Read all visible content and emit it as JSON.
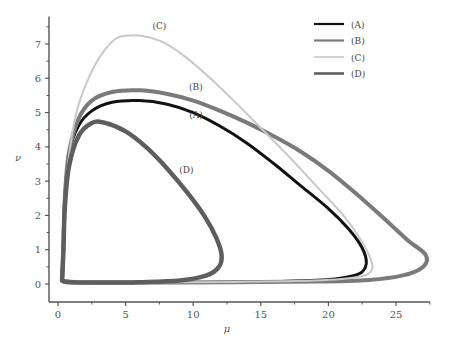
{
  "chart_data": {
    "type": "line",
    "title": "",
    "xlabel": "μ",
    "ylabel": "ν",
    "xlim": [
      -0.5,
      27.5
    ],
    "ylim": [
      -0.35,
      7.8
    ],
    "xticks": [
      0,
      5,
      10,
      15,
      20,
      25
    ],
    "yticks": [
      0,
      1,
      2,
      3,
      4,
      5,
      6,
      7
    ],
    "grid": false,
    "legend_position": "top-right",
    "series": [
      {
        "name": "(A)",
        "color": "#111111",
        "points": [
          [
            0.3,
            0.1
          ],
          [
            0.4,
            1.0
          ],
          [
            0.5,
            2.5
          ],
          [
            0.8,
            3.8
          ],
          [
            1.5,
            4.6
          ],
          [
            2.5,
            5.05
          ],
          [
            4,
            5.3
          ],
          [
            6,
            5.35
          ],
          [
            8,
            5.25
          ],
          [
            10,
            5.0
          ],
          [
            12,
            4.6
          ],
          [
            14,
            4.1
          ],
          [
            16,
            3.5
          ],
          [
            18,
            2.85
          ],
          [
            20,
            2.2
          ],
          [
            21.5,
            1.6
          ],
          [
            22.5,
            1.05
          ],
          [
            22.8,
            0.6
          ],
          [
            22.3,
            0.3
          ],
          [
            20.5,
            0.15
          ],
          [
            17,
            0.08
          ],
          [
            12,
            0.05
          ],
          [
            6,
            0.04
          ],
          [
            1.5,
            0.04
          ],
          [
            0.6,
            0.05
          ],
          [
            0.3,
            0.1
          ]
        ]
      },
      {
        "name": "(B)",
        "color": "#7a7a7a",
        "points": [
          [
            0.3,
            0.1
          ],
          [
            0.4,
            1.0
          ],
          [
            0.5,
            2.5
          ],
          [
            0.8,
            3.8
          ],
          [
            1.5,
            4.8
          ],
          [
            2.5,
            5.35
          ],
          [
            4,
            5.6
          ],
          [
            6,
            5.65
          ],
          [
            8,
            5.55
          ],
          [
            10,
            5.35
          ],
          [
            12,
            5.05
          ],
          [
            14,
            4.7
          ],
          [
            16,
            4.3
          ],
          [
            18,
            3.85
          ],
          [
            20,
            3.3
          ],
          [
            22,
            2.65
          ],
          [
            24,
            1.95
          ],
          [
            25.8,
            1.3
          ],
          [
            27.2,
            0.85
          ],
          [
            27.0,
            0.5
          ],
          [
            25.5,
            0.25
          ],
          [
            23,
            0.12
          ],
          [
            19,
            0.07
          ],
          [
            13,
            0.05
          ],
          [
            6,
            0.04
          ],
          [
            1.5,
            0.04
          ],
          [
            0.6,
            0.05
          ],
          [
            0.3,
            0.1
          ]
        ]
      },
      {
        "name": "(C)",
        "color": "#c8c8c8",
        "points": [
          [
            0.3,
            0.1
          ],
          [
            0.4,
            1.0
          ],
          [
            0.5,
            2.5
          ],
          [
            0.9,
            4.0
          ],
          [
            1.5,
            5.2
          ],
          [
            2.5,
            6.2
          ],
          [
            3.5,
            6.85
          ],
          [
            4.5,
            7.2
          ],
          [
            6,
            7.25
          ],
          [
            7.5,
            7.1
          ],
          [
            9,
            6.75
          ],
          [
            11,
            6.1
          ],
          [
            13,
            5.35
          ],
          [
            15,
            4.55
          ],
          [
            17,
            3.75
          ],
          [
            19,
            2.9
          ],
          [
            21,
            2.05
          ],
          [
            22.3,
            1.35
          ],
          [
            23.1,
            0.75
          ],
          [
            23.2,
            0.4
          ],
          [
            22.2,
            0.2
          ],
          [
            19,
            0.1
          ],
          [
            13,
            0.06
          ],
          [
            6,
            0.04
          ],
          [
            1.5,
            0.04
          ],
          [
            0.6,
            0.05
          ],
          [
            0.3,
            0.1
          ]
        ]
      },
      {
        "name": "(D)",
        "color": "#5e5e5e",
        "points": [
          [
            0.3,
            0.1
          ],
          [
            0.4,
            1.0
          ],
          [
            0.5,
            2.2
          ],
          [
            0.8,
            3.4
          ],
          [
            1.5,
            4.3
          ],
          [
            2.5,
            4.7
          ],
          [
            3.5,
            4.7
          ],
          [
            5,
            4.45
          ],
          [
            6.5,
            4.0
          ],
          [
            8,
            3.4
          ],
          [
            9.5,
            2.7
          ],
          [
            10.8,
            2.0
          ],
          [
            11.7,
            1.35
          ],
          [
            12.1,
            0.85
          ],
          [
            11.9,
            0.5
          ],
          [
            11.0,
            0.25
          ],
          [
            9,
            0.1
          ],
          [
            6,
            0.05
          ],
          [
            3,
            0.04
          ],
          [
            1.2,
            0.05
          ],
          [
            0.5,
            0.08
          ],
          [
            0.3,
            0.1
          ]
        ]
      }
    ],
    "annotations": [
      {
        "text": "(C)",
        "x": 7.5,
        "y": 7.45
      },
      {
        "text": "(B)",
        "x": 10.2,
        "y": 5.65
      },
      {
        "text": "(A)",
        "x": 10.2,
        "y": 4.85
      },
      {
        "text": "(D)",
        "x": 9.5,
        "y": 3.25
      }
    ]
  }
}
